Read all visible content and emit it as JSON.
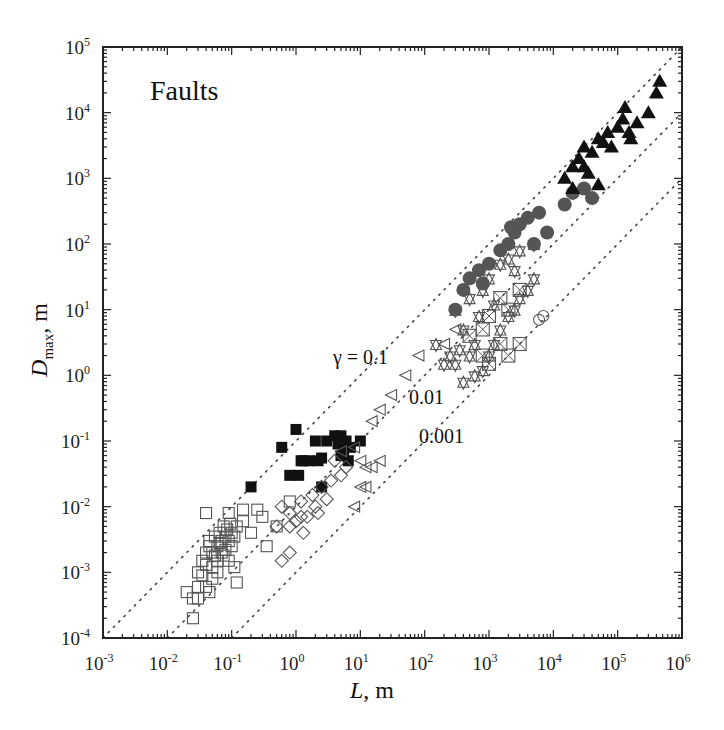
{
  "chart_data": {
    "type": "scatter",
    "title": "Faults",
    "xlabel": "L, m",
    "ylabel": "D_max, m",
    "xscale": "log",
    "yscale": "log",
    "xlim": [
      0.001,
      1000000
    ],
    "ylim": [
      0.0001,
      100000
    ],
    "grid": false,
    "legend": "none",
    "x_tick_labels": [
      "10^-3",
      "10^-2",
      "10^-1",
      "10^0",
      "10^1",
      "10^2",
      "10^3",
      "10^4",
      "10^5",
      "10^6"
    ],
    "y_tick_labels": [
      "10^-4",
      "10^-3",
      "10^-2",
      "10^-1",
      "10^0",
      "10^1",
      "10^2",
      "10^3",
      "10^4",
      "10^5"
    ],
    "reference_lines": [
      {
        "name": "gamma-0.1",
        "label": "γ = 0.1",
        "gamma": 0.1,
        "style": "dotted"
      },
      {
        "name": "gamma-0.01",
        "label": "0.01",
        "gamma": 0.01,
        "style": "dotted"
      },
      {
        "name": "gamma-0.001",
        "label": "0.001",
        "gamma": 0.001,
        "style": "dotted"
      }
    ],
    "series": [
      {
        "name": "open squares",
        "marker": "square-open",
        "points": [
          [
            0.02,
            0.0005
          ],
          [
            0.025,
            0.0004
          ],
          [
            0.03,
            0.0004
          ],
          [
            0.025,
            0.0002
          ],
          [
            0.03,
            0.0006
          ],
          [
            0.04,
            0.0006
          ],
          [
            0.045,
            0.0005
          ],
          [
            0.03,
            0.001
          ],
          [
            0.035,
            0.0015
          ],
          [
            0.04,
            0.002
          ],
          [
            0.045,
            0.003
          ],
          [
            0.05,
            0.002
          ],
          [
            0.05,
            0.0012
          ],
          [
            0.055,
            0.0035
          ],
          [
            0.06,
            0.0025
          ],
          [
            0.06,
            0.0015
          ],
          [
            0.065,
            0.004
          ],
          [
            0.07,
            0.003
          ],
          [
            0.07,
            0.002
          ],
          [
            0.075,
            0.005
          ],
          [
            0.08,
            0.0035
          ],
          [
            0.08,
            0.0022
          ],
          [
            0.085,
            0.0045
          ],
          [
            0.09,
            0.003
          ],
          [
            0.095,
            0.0055
          ],
          [
            0.1,
            0.004
          ],
          [
            0.1,
            0.0025
          ],
          [
            0.11,
            0.0035
          ],
          [
            0.12,
            0.005
          ],
          [
            0.04,
            0.0013
          ],
          [
            0.05,
            0.0008
          ],
          [
            0.06,
            0.001
          ],
          [
            0.035,
            0.0009
          ],
          [
            0.045,
            0.0025
          ],
          [
            0.055,
            0.0018
          ],
          [
            0.065,
            0.0028
          ],
          [
            0.075,
            0.0018
          ],
          [
            0.09,
            0.0015
          ],
          [
            0.11,
            0.0012
          ],
          [
            0.12,
            0.0007
          ],
          [
            0.04,
            0.008
          ],
          [
            0.09,
            0.008
          ],
          [
            0.15,
            0.006
          ],
          [
            0.2,
            0.004
          ],
          [
            0.3,
            0.007
          ],
          [
            0.5,
            0.005
          ],
          [
            0.25,
            0.009
          ],
          [
            0.35,
            0.0025
          ],
          [
            0.8,
            0.012
          ],
          [
            0.15,
            0.009
          ]
        ]
      },
      {
        "name": "filled squares",
        "marker": "square-filled",
        "points": [
          [
            0.2,
            0.02
          ],
          [
            0.6,
            0.08
          ],
          [
            0.8,
            0.03
          ],
          [
            1.2,
            0.05
          ],
          [
            1.0,
            0.15
          ],
          [
            1.3,
            0.05
          ],
          [
            2.0,
            0.1
          ],
          [
            2.2,
            0.05
          ],
          [
            2.5,
            0.055
          ],
          [
            3.0,
            0.1
          ],
          [
            4.0,
            0.12
          ],
          [
            5.0,
            0.12
          ],
          [
            6.0,
            0.1
          ],
          [
            5.5,
            0.07
          ],
          [
            7.0,
            0.08
          ],
          [
            10.0,
            0.1
          ],
          [
            5.0,
            0.06
          ],
          [
            1.1,
            0.03
          ],
          [
            2.5,
            0.02
          ],
          [
            4.5,
            0.09
          ],
          [
            1.6,
            0.05
          ],
          [
            6.5,
            0.05
          ]
        ]
      },
      {
        "name": "open diamonds",
        "marker": "diamond-open",
        "points": [
          [
            0.6,
            0.01
          ],
          [
            0.8,
            0.008
          ],
          [
            1.2,
            0.012
          ],
          [
            1.5,
            0.007
          ],
          [
            1.8,
            0.015
          ],
          [
            2.0,
            0.01
          ],
          [
            2.5,
            0.02
          ],
          [
            3.0,
            0.013
          ],
          [
            0.5,
            0.005
          ],
          [
            0.8,
            0.005
          ],
          [
            1.0,
            0.006
          ],
          [
            1.3,
            0.004
          ],
          [
            0.6,
            0.0015
          ],
          [
            0.8,
            0.002
          ],
          [
            3.5,
            0.025
          ],
          [
            4.0,
            0.05
          ],
          [
            5.0,
            0.03
          ],
          [
            6.0,
            0.04
          ],
          [
            1.2,
            0.007
          ],
          [
            2.2,
            0.008
          ]
        ]
      },
      {
        "name": "open left triangles",
        "marker": "triangle-left-open",
        "points": [
          [
            5.0,
            0.07
          ],
          [
            8.0,
            0.08
          ],
          [
            10.0,
            0.05
          ],
          [
            12.0,
            0.04
          ],
          [
            15.0,
            0.04
          ],
          [
            20.0,
            0.05
          ],
          [
            10.0,
            0.02
          ],
          [
            12.0,
            0.02
          ],
          [
            8.0,
            0.01
          ],
          [
            15.0,
            0.2
          ],
          [
            20.0,
            0.3
          ],
          [
            30.0,
            0.5
          ],
          [
            50.0,
            1.0
          ],
          [
            80.0,
            2.0
          ],
          [
            200.0,
            3.0
          ],
          [
            300.0,
            5.0
          ]
        ]
      },
      {
        "name": "open triangles (up/down, boxed)",
        "marker": "triangle-open",
        "points": [
          [
            150.0,
            3.0
          ],
          [
            200.0,
            1.5
          ],
          [
            250.0,
            2.0
          ],
          [
            300.0,
            1.5
          ],
          [
            350.0,
            2.5
          ],
          [
            400.0,
            5.0
          ],
          [
            500.0,
            2.0
          ],
          [
            600.0,
            1.0
          ],
          [
            800.0,
            1.2
          ],
          [
            1000.0,
            2.0
          ],
          [
            1200.0,
            3.0
          ],
          [
            1500.0,
            5.0
          ],
          [
            2000.0,
            8.0
          ],
          [
            2500.0,
            10.0
          ],
          [
            3000.0,
            15.0
          ],
          [
            4000.0,
            20.0
          ],
          [
            5000.0,
            30.0
          ],
          [
            300.0,
            10.0
          ],
          [
            500.0,
            15.0
          ],
          [
            800.0,
            20.0
          ],
          [
            1000.0,
            30.0
          ],
          [
            1500.0,
            50.0
          ],
          [
            2000.0,
            60.0
          ],
          [
            3000.0,
            80.0
          ],
          [
            5000.0,
            100.0
          ],
          [
            700.0,
            8.0
          ],
          [
            1200.0,
            12.0
          ],
          [
            2500.0,
            40.0
          ],
          [
            400.0,
            0.8
          ],
          [
            600.0,
            3.0
          ]
        ]
      },
      {
        "name": "boxed X",
        "marker": "square-x",
        "points": [
          [
            500.0,
            4.0
          ],
          [
            800.0,
            2.0
          ],
          [
            1000.0,
            1.5
          ],
          [
            1500.0,
            3.0
          ],
          [
            2000.0,
            2.0
          ],
          [
            3000.0,
            3.0
          ],
          [
            1000.0,
            8.0
          ],
          [
            2000.0,
            10.0
          ],
          [
            3000.0,
            20.0
          ],
          [
            1500.0,
            15.0
          ],
          [
            800.0,
            5.0
          ]
        ]
      },
      {
        "name": "open circles",
        "marker": "circle-open",
        "points": [
          [
            6000.0,
            7.0
          ],
          [
            7000.0,
            8.0
          ]
        ]
      },
      {
        "name": "gray filled circles",
        "marker": "circle-filled-gray",
        "points": [
          [
            300.0,
            10.0
          ],
          [
            400.0,
            20.0
          ],
          [
            500.0,
            30.0
          ],
          [
            700.0,
            40.0
          ],
          [
            1000.0,
            50.0
          ],
          [
            800.0,
            25.0
          ],
          [
            1500.0,
            80.0
          ],
          [
            2000.0,
            100.0
          ],
          [
            2500.0,
            150.0
          ],
          [
            3000.0,
            200.0
          ],
          [
            4000.0,
            250.0
          ],
          [
            5000.0,
            100.0
          ],
          [
            2200.0,
            180.0
          ],
          [
            6000.0,
            300.0
          ],
          [
            8000.0,
            150.0
          ],
          [
            15000.0,
            400.0
          ],
          [
            20000.0,
            600.0
          ],
          [
            30000.0,
            700.0
          ],
          [
            40000.0,
            500.0
          ]
        ]
      },
      {
        "name": "filled triangles",
        "marker": "triangle-filled",
        "points": [
          [
            15000.0,
            1000.0
          ],
          [
            20000.0,
            1500.0
          ],
          [
            25000.0,
            2000.0
          ],
          [
            30000.0,
            3000.0
          ],
          [
            35000.0,
            1200.0
          ],
          [
            40000.0,
            2500.0
          ],
          [
            50000.0,
            4000.0
          ],
          [
            60000.0,
            3500.0
          ],
          [
            70000.0,
            5000.0
          ],
          [
            80000.0,
            3000.0
          ],
          [
            100000.0,
            6000.0
          ],
          [
            120000.0,
            8000.0
          ],
          [
            130000.0,
            12000.0
          ],
          [
            150000.0,
            5000.0
          ],
          [
            160000.0,
            4000.0
          ],
          [
            200000.0,
            7000.0
          ],
          [
            300000.0,
            10000.0
          ],
          [
            400000.0,
            20000.0
          ],
          [
            450000.0,
            30000.0
          ],
          [
            50000.0,
            800.0
          ],
          [
            20000.0,
            700.0
          ],
          [
            30000.0,
            1500.0
          ]
        ]
      }
    ],
    "annotations": [
      {
        "text": "Faults",
        "position": "top-left"
      },
      {
        "text": "γ = 0.1"
      },
      {
        "text": "0.01"
      },
      {
        "text": "0.001"
      }
    ]
  },
  "labels": {
    "panel_title": "Faults",
    "xlabel_italic": "L",
    "xlabel_rest": ", m",
    "ylabel_italic": "D",
    "ylabel_sub": "max",
    "ylabel_rest": ", m",
    "gamma_01": "γ = 0.1",
    "gamma_001": "0.01",
    "gamma_0001": "0.001"
  },
  "colors": {
    "axis": "#222222",
    "filled": "#111111",
    "gray_circle": "#555555",
    "open_marker": "#555555",
    "dotted_line": "#444444"
  }
}
